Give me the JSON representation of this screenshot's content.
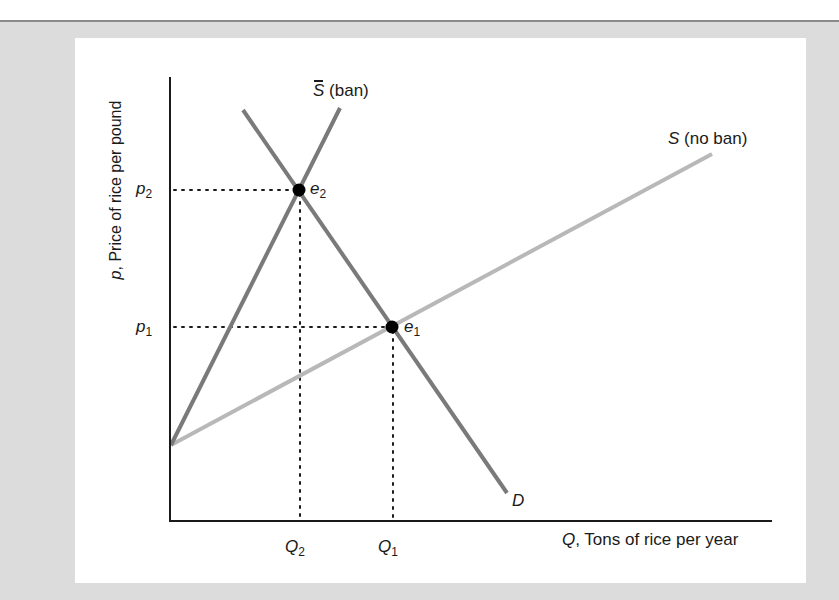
{
  "figure": {
    "y_axis_label": {
      "var": "p",
      "text": ", Price of rice per pound"
    },
    "x_axis_label": {
      "var": "Q",
      "text": ", Tons of rice per year"
    },
    "ticks": {
      "p2": {
        "var": "p",
        "sub": "2"
      },
      "p1": {
        "var": "p",
        "sub": "1"
      },
      "q2": {
        "var": "Q",
        "sub": "2"
      },
      "q1": {
        "var": "Q",
        "sub": "1"
      }
    },
    "curves": {
      "demand": {
        "label": "D",
        "color": "#7a7a7a"
      },
      "supply_ban": {
        "label_var": "S",
        "label_text": " (ban)",
        "color": "#7a7a7a"
      },
      "supply_no_ban": {
        "label_var": "S",
        "label_text": " (no ban)",
        "color": "#b8b8b8"
      }
    },
    "points": {
      "e1": {
        "var": "e",
        "sub": "1"
      },
      "e2": {
        "var": "e",
        "sub": "2"
      }
    },
    "colors": {
      "axis": "#1a1a1a",
      "panel_bg": "#ffffff",
      "frame_bg": "#dcdcdc"
    }
  }
}
